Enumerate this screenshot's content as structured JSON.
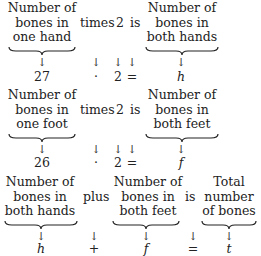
{
  "equations": [
    {
      "left": {
        "lines": [
          "Number of",
          "bones in",
          "one hand"
        ]
      },
      "op_word": "times",
      "factor": "2",
      "rel_word": "is",
      "right": {
        "lines": [
          "Number of",
          "bones in",
          "both hands"
        ]
      },
      "math": {
        "left": "27",
        "op": "·",
        "factor": "2",
        "rel": "=",
        "right": "h"
      }
    },
    {
      "left": {
        "lines": [
          "Number of",
          "bones in",
          "one foot"
        ]
      },
      "op_word": "times",
      "factor": "2",
      "rel_word": "is",
      "right": {
        "lines": [
          "Number of",
          "bones in",
          "both feet"
        ]
      },
      "math": {
        "left": "26",
        "op": "·",
        "factor": "2",
        "rel": "=",
        "right": "f"
      }
    },
    {
      "left": {
        "lines": [
          "Number of",
          "bones in",
          "both hands"
        ]
      },
      "op_word": "plus",
      "middle": {
        "lines": [
          "Number of",
          "bones in",
          "both feet"
        ]
      },
      "rel_word": "is",
      "right": {
        "lines": [
          "Total",
          "number",
          "of bones"
        ]
      },
      "math": {
        "left": "h",
        "op": "+",
        "middle": "f",
        "rel": "=",
        "right": "t"
      }
    }
  ],
  "arrow_glyph": "↓"
}
